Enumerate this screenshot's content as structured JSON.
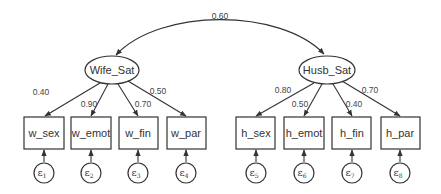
{
  "diagram": {
    "type": "structural_equation_model",
    "covariance": {
      "from": "Wife_Sat",
      "to": "Husb_Sat",
      "label": "0.60"
    },
    "latents": [
      {
        "id": "Wife_Sat",
        "label": "Wife_Sat"
      },
      {
        "id": "Husb_Sat",
        "label": "Husb_Sat"
      }
    ],
    "observed": [
      {
        "id": "w_sex",
        "label": "w_sex",
        "latent": "Wife_Sat",
        "loading": "0.40",
        "error": "ε",
        "error_sub": "1"
      },
      {
        "id": "w_emot",
        "label": "w_emot",
        "latent": "Wife_Sat",
        "loading": "0.90",
        "error": "ε",
        "error_sub": "2"
      },
      {
        "id": "w_fin",
        "label": "w_fin",
        "latent": "Wife_Sat",
        "loading": "0.70",
        "error": "ε",
        "error_sub": "3"
      },
      {
        "id": "w_par",
        "label": "w_par",
        "latent": "Wife_Sat",
        "loading": "0.50",
        "error": "ε",
        "error_sub": "4"
      },
      {
        "id": "h_sex",
        "label": "h_sex",
        "latent": "Husb_Sat",
        "loading": "0.80",
        "error": "ε",
        "error_sub": "5"
      },
      {
        "id": "h_emot",
        "label": "h_emot",
        "latent": "Husb_Sat",
        "loading": "0.50",
        "error": "ε",
        "error_sub": "6"
      },
      {
        "id": "h_fin",
        "label": "h_fin",
        "latent": "Husb_Sat",
        "loading": "0.40",
        "error": "ε",
        "error_sub": "7"
      },
      {
        "id": "h_par",
        "label": "h_par",
        "latent": "Husb_Sat",
        "loading": "0.70",
        "error": "ε",
        "error_sub": "8"
      }
    ]
  }
}
